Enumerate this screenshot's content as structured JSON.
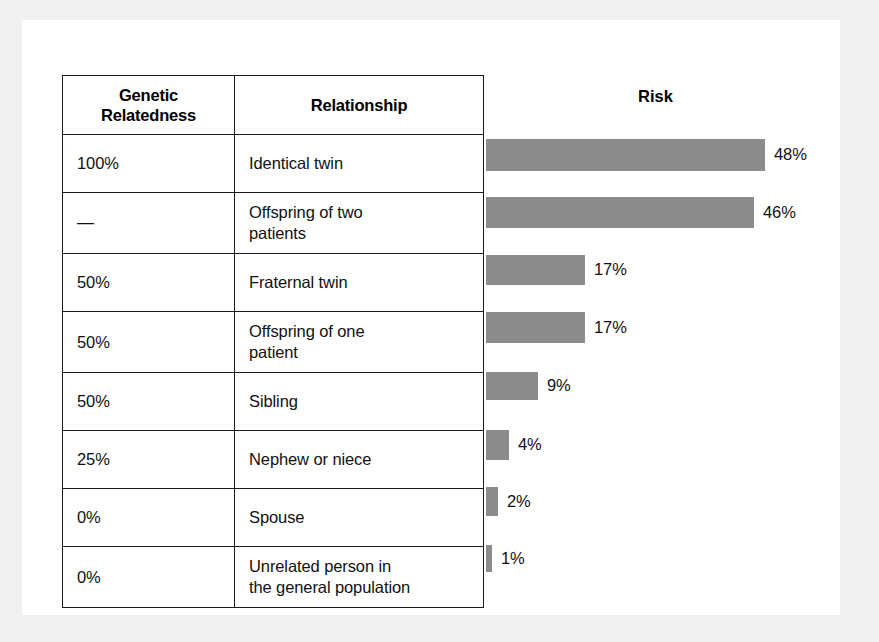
{
  "figure": {
    "table": {
      "headers": [
        "Genetic\nRelatedness",
        "Relationship"
      ],
      "header_genetic_line1": "Genetic",
      "header_genetic_line2": "Relatedness",
      "header_relationship": "Relationship",
      "chart_header": "Risk"
    },
    "rows": [
      {
        "genetic_relatedness": "100%",
        "relationship": "Identical twin",
        "relationship_line1": "Identical twin",
        "relationship_line2": "",
        "risk_label": "48%",
        "risk_value": 48
      },
      {
        "genetic_relatedness": "—",
        "relationship": "Offspring of two patients",
        "relationship_line1": "Offspring of two",
        "relationship_line2": "patients",
        "risk_label": "46%",
        "risk_value": 46
      },
      {
        "genetic_relatedness": "50%",
        "relationship": "Fraternal twin",
        "relationship_line1": "Fraternal twin",
        "relationship_line2": "",
        "risk_label": "17%",
        "risk_value": 17
      },
      {
        "genetic_relatedness": "50%",
        "relationship": "Offspring of one patient",
        "relationship_line1": "Offspring of one",
        "relationship_line2": "patient",
        "risk_label": "17%",
        "risk_value": 17
      },
      {
        "genetic_relatedness": "50%",
        "relationship": "Sibling",
        "relationship_line1": "Sibling",
        "relationship_line2": "",
        "risk_label": "9%",
        "risk_value": 9
      },
      {
        "genetic_relatedness": "25%",
        "relationship": "Nephew or niece",
        "relationship_line1": "Nephew or niece",
        "relationship_line2": "",
        "risk_label": "4%",
        "risk_value": 4
      },
      {
        "genetic_relatedness": "0%",
        "relationship": "Spouse",
        "relationship_line1": "Spouse",
        "relationship_line2": "",
        "risk_label": "2%",
        "risk_value": 2
      },
      {
        "genetic_relatedness": "0%",
        "relationship": "Unrelated person in the general population",
        "relationship_line1": "Unrelated person in",
        "relationship_line2": "the general population",
        "risk_label": "1%",
        "risk_value": 1
      }
    ],
    "colors": {
      "bar_fill": "#8c8c8c",
      "table_border": "#1a1a1a",
      "text": "#111111",
      "page_background": "#ffffff",
      "scan_background": "#f0f0f0"
    }
  },
  "chart_data": {
    "type": "bar",
    "title": "Risk",
    "orientation": "horizontal",
    "xlabel": "",
    "ylabel": "",
    "categories": [
      "Identical twin",
      "Offspring of two patients",
      "Fraternal twin",
      "Offspring of one patient",
      "Sibling",
      "Nephew or niece",
      "Spouse",
      "Unrelated person in the general population"
    ],
    "values": [
      48,
      46,
      17,
      17,
      9,
      4,
      2,
      1
    ],
    "data_labels": [
      "48%",
      "46%",
      "17%",
      "17%",
      "9%",
      "4%",
      "2%",
      "1%"
    ],
    "xlim": [
      0,
      48
    ],
    "grid": false,
    "legend": false,
    "units": "percent",
    "annotations": {
      "genetic_relatedness": [
        "100%",
        "—",
        "50%",
        "50%",
        "50%",
        "25%",
        "0%",
        "0%"
      ]
    }
  }
}
